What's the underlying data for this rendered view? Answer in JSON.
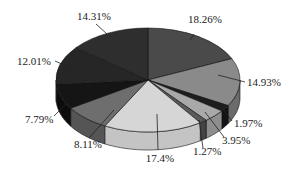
{
  "chart_data": {
    "type": "pie",
    "style": "3d",
    "title": "",
    "start_angle_deg": 0,
    "direction": "clockwise",
    "slices": [
      {
        "label": "18.26%",
        "value": 18.26,
        "color": "#4a4a4a",
        "side": "#353535"
      },
      {
        "label": "14.93%",
        "value": 14.93,
        "color": "#8a8a8a",
        "side": "#6b6b6b"
      },
      {
        "label": "1.97%",
        "value": 1.97,
        "color": "#1e1e1e",
        "side": "#141414"
      },
      {
        "label": "3.95%",
        "value": 3.95,
        "color": "#a9a9a9",
        "side": "#8e8e8e"
      },
      {
        "label": "1.27%",
        "value": 1.27,
        "color": "#5a5a5a",
        "side": "#444444"
      },
      {
        "label": "17.4%",
        "value": 17.4,
        "color": "#d6d6d6",
        "side": "#c4c4c4"
      },
      {
        "label": "8.11%",
        "value": 8.11,
        "color": "#6e6e6e",
        "side": "#555555"
      },
      {
        "label": "7.79%",
        "value": 7.79,
        "color": "#151515",
        "side": "#0c0c0c"
      },
      {
        "label": "12.01%",
        "value": 12.01,
        "color": "#262626",
        "side": "#1a1a1a"
      },
      {
        "label": "14.31%",
        "value": 14.31,
        "color": "#2e2e2e",
        "side": "#202020"
      }
    ],
    "label_positions": [
      {
        "x": 188,
        "y": 23,
        "anchor": "start",
        "lx": 194,
        "ly": 34,
        "px": 190,
        "py": 40
      },
      {
        "x": 247,
        "y": 86,
        "anchor": "start",
        "lx": 245,
        "ly": 82,
        "px": 218,
        "py": 75
      },
      {
        "x": 234,
        "y": 127,
        "anchor": "start",
        "lx": 232,
        "ly": 121,
        "px": 222,
        "py": 108
      },
      {
        "x": 222,
        "y": 144,
        "anchor": "start",
        "lx": 224,
        "ly": 137,
        "px": 205,
        "py": 112
      },
      {
        "x": 193,
        "y": 155,
        "anchor": "start",
        "lx": 203,
        "ly": 148,
        "px": 199,
        "py": 120
      },
      {
        "x": 160,
        "y": 162,
        "anchor": "middle",
        "lx": 158,
        "ly": 150,
        "px": 157,
        "py": 114
      },
      {
        "x": 74,
        "y": 148,
        "anchor": "start",
        "lx": 89,
        "ly": 138,
        "px": 114,
        "py": 110
      },
      {
        "x": 25,
        "y": 123,
        "anchor": "start",
        "lx": 54,
        "ly": 116,
        "px": 67,
        "py": 103
      },
      {
        "x": 17,
        "y": 65,
        "anchor": "start",
        "lx": 55,
        "ly": 61,
        "px": 73,
        "py": 69
      },
      {
        "x": 77,
        "y": 20,
        "anchor": "start",
        "lx": 96,
        "ly": 24,
        "px": 107,
        "py": 34
      }
    ],
    "geometry": {
      "cx": 148,
      "cy": 80,
      "rx": 92,
      "ry": 52,
      "depth": 18
    },
    "legend": null,
    "grid": false
  }
}
